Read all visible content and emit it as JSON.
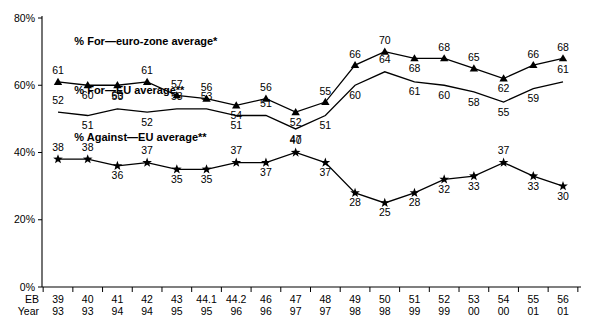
{
  "chart_data": {
    "type": "line",
    "title": "",
    "xlabel": "",
    "ylabel": "",
    "ylim": [
      0,
      80
    ],
    "yticks": [
      0,
      20,
      40,
      60,
      80
    ],
    "ytick_labels": [
      "0%",
      "20%",
      "40%",
      "60%",
      "80%"
    ],
    "grid": false,
    "legend_position": "inline-labels",
    "x_axis_rows": [
      {
        "row_label": "EB",
        "values": [
          "39",
          "40",
          "41",
          "42",
          "43",
          "44.1",
          "44.2",
          "46",
          "47",
          "48",
          "49",
          "50",
          "51",
          "52",
          "53",
          "54",
          "55",
          "56"
        ]
      },
      {
        "row_label": "Year",
        "values": [
          "93",
          "93",
          "94",
          "94",
          "95",
          "95",
          "96",
          "96",
          "97",
          "97",
          "98",
          "98",
          "99",
          "99",
          "00",
          "00",
          "01",
          "01"
        ]
      }
    ],
    "categories": [
      "39",
      "40",
      "41",
      "42",
      "43",
      "44.1",
      "44.2",
      "46",
      "47",
      "48",
      "49",
      "50",
      "51",
      "52",
      "53",
      "54",
      "55",
      "56"
    ],
    "series": [
      {
        "name": "% For—euro-zone average*",
        "marker": "triangle",
        "label_position": "above",
        "values": [
          61,
          60,
          60,
          61,
          57,
          56,
          54,
          56,
          52,
          55,
          66,
          70,
          68,
          68,
          65,
          62,
          66,
          68
        ]
      },
      {
        "name": "% For—EU average**",
        "marker": "none",
        "label_position": "below",
        "values": [
          52,
          51,
          53,
          52,
          53,
          53,
          51,
          51,
          47,
          51,
          60,
          64,
          61,
          60,
          58,
          55,
          59,
          61
        ]
      },
      {
        "name": "% Against—EU average**",
        "marker": "star",
        "label_position": "below",
        "values": [
          38,
          38,
          36,
          37,
          35,
          35,
          37,
          37,
          40,
          37,
          28,
          25,
          28,
          32,
          33,
          37,
          33,
          30
        ]
      }
    ],
    "annotations": [
      {
        "text": "% For—euro-zone average*",
        "x_index": 0.55,
        "y_value": 72
      },
      {
        "text": "% For—EU average**",
        "x_index": 0.55,
        "y_value": 57.5
      },
      {
        "text": "% Against—EU average**",
        "x_index": 0.55,
        "y_value": 43.5
      }
    ],
    "colors": {
      "ink": "#000000",
      "background": "#ffffff"
    }
  },
  "footnote": ""
}
